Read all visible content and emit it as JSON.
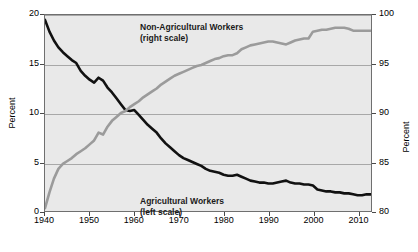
{
  "chart_data": {
    "type": "line",
    "title": "",
    "subtitle": "",
    "xlabel": "",
    "ylabel": "Percent",
    "ylabel_right": "Percent",
    "xlim": [
      1940,
      2013
    ],
    "ylim": [
      0,
      20
    ],
    "ylim_right": [
      80,
      100
    ],
    "grid": true,
    "legend_position": "inside-annotations",
    "x_ticks": [
      "1940",
      "1950",
      "1960",
      "1970",
      "1980",
      "1990",
      "2000",
      "2010"
    ],
    "x_tick_values": [
      1940,
      1950,
      1960,
      1970,
      1980,
      1990,
      2000,
      2010
    ],
    "y_ticks_left": [
      "0",
      "5",
      "10",
      "15",
      "20"
    ],
    "y_tick_values_left": [
      0,
      5,
      10,
      15,
      20
    ],
    "y_ticks_right": [
      "80",
      "85",
      "90",
      "95",
      "100"
    ],
    "y_tick_values_right": [
      80,
      85,
      90,
      95,
      100
    ],
    "annotations": [
      {
        "name": "non-agricultural-workers",
        "line1": "Non-Agricultural Workers",
        "line2": "(right scale)"
      },
      {
        "name": "agricultural-workers",
        "line1": "Agricultural Workers",
        "line2": "(left scale)"
      }
    ],
    "series": [
      {
        "name": "Agricultural Workers",
        "scale": "left",
        "color": "#111111",
        "x": [
          1940,
          1941,
          1942,
          1943,
          1944,
          1945,
          1946,
          1947,
          1948,
          1949,
          1950,
          1951,
          1952,
          1953,
          1954,
          1955,
          1956,
          1957,
          1958,
          1959,
          1960,
          1961,
          1962,
          1963,
          1964,
          1965,
          1966,
          1967,
          1968,
          1969,
          1970,
          1971,
          1972,
          1973,
          1974,
          1975,
          1976,
          1977,
          1978,
          1979,
          1980,
          1981,
          1982,
          1983,
          1984,
          1985,
          1986,
          1987,
          1988,
          1989,
          1990,
          1991,
          1992,
          1993,
          1994,
          1995,
          1996,
          1997,
          1998,
          1999,
          2000,
          2001,
          2002,
          2003,
          2004,
          2005,
          2006,
          2007,
          2008,
          2009,
          2010,
          2011,
          2012,
          2013
        ],
        "values": [
          19.5,
          18.3,
          17.4,
          16.7,
          16.2,
          15.8,
          15.4,
          15.1,
          14.3,
          13.8,
          13.4,
          13.1,
          13.6,
          13.3,
          12.6,
          12.1,
          11.5,
          10.9,
          10.3,
          10.2,
          10.3,
          9.8,
          9.3,
          8.8,
          8.4,
          8.0,
          7.4,
          6.9,
          6.5,
          6.1,
          5.7,
          5.4,
          5.2,
          5.0,
          4.8,
          4.6,
          4.3,
          4.1,
          4.0,
          3.9,
          3.7,
          3.6,
          3.6,
          3.7,
          3.5,
          3.3,
          3.1,
          3.0,
          2.9,
          2.9,
          2.8,
          2.8,
          2.9,
          3.0,
          3.1,
          2.9,
          2.8,
          2.8,
          2.7,
          2.7,
          2.6,
          2.2,
          2.1,
          2.0,
          2.0,
          1.9,
          1.9,
          1.8,
          1.8,
          1.7,
          1.6,
          1.6,
          1.7,
          1.7
        ]
      },
      {
        "name": "Non-Agricultural Workers",
        "scale": "right",
        "color": "#9b9b9b",
        "x": [
          1940,
          1941,
          1942,
          1943,
          1944,
          1945,
          1946,
          1947,
          1948,
          1949,
          1950,
          1951,
          1952,
          1953,
          1954,
          1955,
          1956,
          1957,
          1958,
          1959,
          1960,
          1961,
          1962,
          1963,
          1964,
          1965,
          1966,
          1967,
          1968,
          1969,
          1970,
          1971,
          1972,
          1973,
          1974,
          1975,
          1976,
          1977,
          1978,
          1979,
          1980,
          1981,
          1982,
          1983,
          1984,
          1985,
          1986,
          1987,
          1988,
          1989,
          1990,
          1991,
          1992,
          1993,
          1994,
          1995,
          1996,
          1997,
          1998,
          1999,
          2000,
          2001,
          2002,
          2003,
          2004,
          2005,
          2006,
          2007,
          2008,
          2009,
          2010,
          2011,
          2012,
          2013
        ],
        "values": [
          80.3,
          81.9,
          83.3,
          84.3,
          84.8,
          85.1,
          85.4,
          85.8,
          86.1,
          86.4,
          86.8,
          87.2,
          88.0,
          87.8,
          88.6,
          89.2,
          89.6,
          90.0,
          90.2,
          90.6,
          90.9,
          91.2,
          91.6,
          91.9,
          92.2,
          92.5,
          92.9,
          93.2,
          93.5,
          93.8,
          94.0,
          94.2,
          94.4,
          94.6,
          94.8,
          94.9,
          95.1,
          95.3,
          95.5,
          95.6,
          95.8,
          95.9,
          95.9,
          96.1,
          96.5,
          96.7,
          96.9,
          97.0,
          97.1,
          97.2,
          97.3,
          97.3,
          97.2,
          97.1,
          97.0,
          97.2,
          97.4,
          97.5,
          97.6,
          97.6,
          98.3,
          98.4,
          98.5,
          98.5,
          98.6,
          98.7,
          98.7,
          98.7,
          98.6,
          98.4,
          98.4,
          98.4,
          98.4,
          98.4
        ]
      }
    ]
  }
}
